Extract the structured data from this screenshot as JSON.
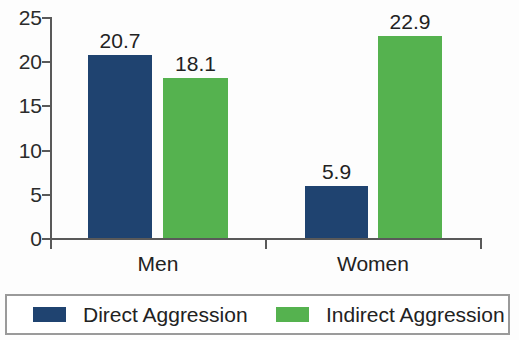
{
  "chart_data": {
    "type": "bar",
    "title": "",
    "subtitle": "",
    "xlabel": "",
    "ylabel": "",
    "categories": [
      "Men",
      "Women"
    ],
    "series": [
      {
        "name": "Direct Aggression",
        "color": "#1f4370",
        "values": [
          20.7,
          5.9
        ]
      },
      {
        "name": "Indirect Aggression",
        "color": "#55b24f",
        "values": [
          18.1,
          22.9
        ]
      }
    ],
    "value_labels": [
      {
        "text": "20.7",
        "series": "Direct Aggression",
        "category": "Men"
      },
      {
        "text": "18.1",
        "series": "Indirect Aggression",
        "category": "Men"
      },
      {
        "text": "5.9",
        "series": "Direct Aggression",
        "category": "Women"
      },
      {
        "text": "22.9",
        "series": "Indirect Aggression",
        "category": "Women"
      }
    ],
    "ylim": [
      0,
      25
    ],
    "ytick_labels": [
      "0",
      "5",
      "10",
      "15",
      "20",
      "25"
    ],
    "ytick_values": [
      0,
      5,
      10,
      15,
      20,
      25
    ],
    "grid": false,
    "legend_position": "bottom"
  },
  "axis": {
    "y_ticks": [
      {
        "label": "25",
        "value": 25
      },
      {
        "label": "20",
        "value": 20
      },
      {
        "label": "15",
        "value": 15
      },
      {
        "label": "10",
        "value": 10
      },
      {
        "label": "5",
        "value": 5
      },
      {
        "label": "0",
        "value": 0
      }
    ],
    "x_categories": [
      {
        "label": "Men"
      },
      {
        "label": "Women"
      }
    ]
  },
  "bars": [
    {
      "label": "20.7",
      "series": "Direct Aggression",
      "category": "Men"
    },
    {
      "label": "18.1",
      "series": "Indirect Aggression",
      "category": "Men"
    },
    {
      "label": "5.9",
      "series": "Direct Aggression",
      "category": "Women"
    },
    {
      "label": "22.9",
      "series": "Indirect Aggression",
      "category": "Women"
    }
  ],
  "legend": {
    "items": [
      {
        "label": "Direct Aggression",
        "color": "#1f4370"
      },
      {
        "label": "Indirect Aggression",
        "color": "#55b24f"
      }
    ]
  },
  "colors": {
    "direct": "#1f4370",
    "indirect": "#55b24f",
    "axis": "#595959",
    "text": "#222222",
    "legend_border": "#9a9a9a",
    "background": "#fdfdfd"
  }
}
